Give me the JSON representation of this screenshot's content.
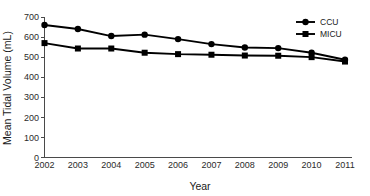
{
  "chart_data": {
    "type": "line",
    "title": "",
    "xlabel": "Year",
    "ylabel": "Mean Tidal Volume (mL)",
    "categories": [
      "2002",
      "2003",
      "2004",
      "2005",
      "2006",
      "2007",
      "2008",
      "2009",
      "2010",
      "2011"
    ],
    "x": [
      2002,
      2003,
      2004,
      2005,
      2006,
      2007,
      2008,
      2009,
      2010,
      2011
    ],
    "series": [
      {
        "name": "CCU",
        "marker": "circle",
        "color": "#000000",
        "values": [
          660,
          640,
          605,
          612,
          590,
          565,
          548,
          545,
          522,
          487
        ]
      },
      {
        "name": "MICU",
        "marker": "square",
        "color": "#000000",
        "values": [
          570,
          543,
          543,
          522,
          515,
          512,
          508,
          507,
          500,
          478
        ]
      }
    ],
    "ylim": [
      0,
      700
    ],
    "xlim": [
      2002,
      2011
    ],
    "yticks": [
      0,
      100,
      200,
      300,
      400,
      500,
      600,
      700
    ],
    "ytick_labels": [
      "0",
      "100",
      "200",
      "300",
      "400",
      "500",
      "600",
      "700"
    ],
    "xticks": [
      2002,
      2003,
      2004,
      2005,
      2006,
      2007,
      2008,
      2009,
      2010,
      2011
    ],
    "grid": false,
    "legend_position": "top-right",
    "legend": [
      "CCU",
      "MICU"
    ]
  },
  "axis": {
    "y_title": "Mean Tidal Volume (mL)",
    "x_title": "Year"
  },
  "legend": {
    "items": [
      {
        "label": "CCU",
        "marker": "circle-marker"
      },
      {
        "label": "MICU",
        "marker": "square-marker"
      }
    ]
  }
}
